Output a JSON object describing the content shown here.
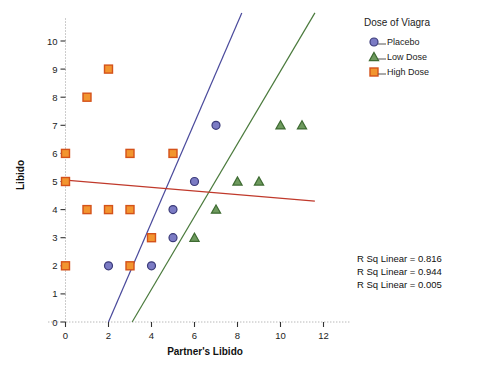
{
  "chart_data": {
    "type": "scatter",
    "title": "",
    "xlabel": "Partner's Libido",
    "ylabel": "Libido",
    "xlim": [
      -0.8,
      13.2
    ],
    "ylim": [
      0,
      10.8
    ],
    "xticks": [
      0,
      2,
      4,
      6,
      8,
      10,
      12
    ],
    "yticks": [
      0,
      1,
      2,
      3,
      4,
      5,
      6,
      7,
      8,
      9,
      10
    ],
    "grid": false,
    "legend": {
      "title": "Dose of Viagra",
      "position": "top-right",
      "entries": [
        {
          "label": "Placebo",
          "marker": "circle",
          "color": "#4a4a9c"
        },
        {
          "label": "Low Dose",
          "marker": "triangle",
          "color": "#4a7a3c"
        },
        {
          "label": "High Dose",
          "marker": "square",
          "color": "#e8701a"
        }
      ]
    },
    "series": [
      {
        "name": "Placebo",
        "marker": "circle",
        "color": "#4a4a9c",
        "points": [
          [
            2,
            2
          ],
          [
            4,
            2
          ],
          [
            5,
            3
          ],
          [
            5,
            4
          ],
          [
            6,
            5
          ],
          [
            7,
            7
          ]
        ],
        "fit": {
          "x0": 2.0,
          "y0": 0.0,
          "x1": 8.2,
          "y1": 11.0,
          "color": "#4a4a9c"
        }
      },
      {
        "name": "Low Dose",
        "marker": "triangle",
        "color": "#4a7a3c",
        "points": [
          [
            6,
            3
          ],
          [
            7,
            4
          ],
          [
            8,
            5
          ],
          [
            9,
            5
          ],
          [
            10,
            7
          ],
          [
            11,
            7
          ]
        ],
        "fit": {
          "x0": 3.1,
          "y0": 0.0,
          "x1": 11.6,
          "y1": 11.0,
          "color": "#4a7a3c"
        }
      },
      {
        "name": "High Dose",
        "marker": "square",
        "color": "#e8701a",
        "points": [
          [
            0,
            2
          ],
          [
            0,
            5
          ],
          [
            0,
            6
          ],
          [
            1,
            4
          ],
          [
            1,
            8
          ],
          [
            2,
            4
          ],
          [
            2,
            9
          ],
          [
            3,
            2
          ],
          [
            3,
            4
          ],
          [
            3,
            6
          ],
          [
            4,
            3
          ],
          [
            5,
            6
          ]
        ],
        "fit": {
          "x0": 0.0,
          "y0": 5.05,
          "x1": 11.6,
          "y1": 4.3,
          "color": "#c0392b"
        }
      }
    ],
    "annotations": [
      "R Sq Linear = 0.816",
      "R Sq Linear = 0.944",
      "R Sq Linear = 0.005"
    ]
  }
}
